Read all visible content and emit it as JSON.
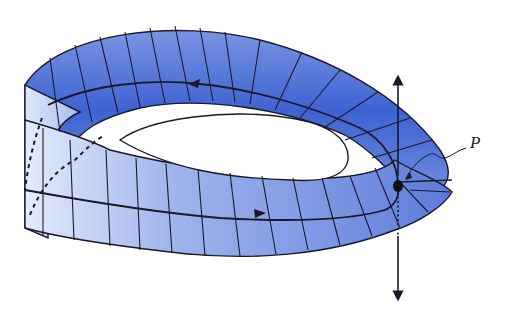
{
  "figure": {
    "point_label": "P",
    "colors": {
      "strip_dark": "#3a5fd0",
      "strip_mid": "#6f8ee0",
      "strip_light": "#dfe7fa",
      "line": "#1a1a2a",
      "background": "#ffffff"
    },
    "elements": [
      {
        "name": "mobius-strip",
        "description": "blue shaded Möbius band with grid lines"
      },
      {
        "name": "center-loop",
        "description": "closed path along strip center with two direction arrows"
      },
      {
        "name": "normal-vector",
        "description": "double-headed vertical arrow through P"
      },
      {
        "name": "hidden-path",
        "description": "dashed hidden portion of center loop on left edge"
      }
    ]
  }
}
